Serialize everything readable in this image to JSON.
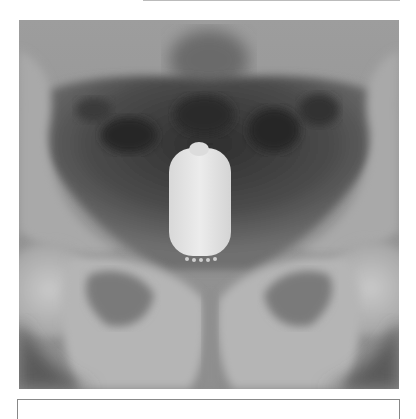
{
  "figure": {
    "type": "radiograph",
    "caption": ""
  }
}
